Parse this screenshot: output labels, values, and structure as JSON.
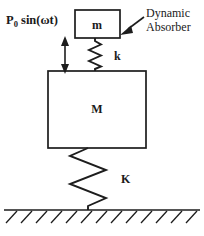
{
  "diagram": {
    "figure_type": "two-degree-of-freedom mass-spring system",
    "background_color": "#ffffff",
    "line_color": "#1d1d1d",
    "canvas": {
      "width": 204,
      "height": 236
    }
  },
  "labels": {
    "force": {
      "base": "P",
      "subscript": "0",
      "expression": " sin(ωt)",
      "full_text": "P0 sin(ωt)",
      "x": 6,
      "y": 24
    },
    "absorber_mass": {
      "text": "m",
      "x": 97,
      "y": 29
    },
    "absorber_spring": {
      "text": "k",
      "x": 114,
      "y": 60
    },
    "main_mass": {
      "text": "M",
      "x": 97,
      "y": 113
    },
    "main_spring": {
      "text": "K",
      "x": 121,
      "y": 183
    },
    "annotation": {
      "line1": "Dynamic",
      "line2": "Absorber",
      "x": 146,
      "y_line1": 17,
      "y_line2": 31
    }
  },
  "geometry": {
    "absorber_box": {
      "x": 75,
      "y": 10,
      "width": 45,
      "height": 28
    },
    "main_box": {
      "x": 48,
      "y": 71,
      "width": 98,
      "height": 77
    },
    "absorber_spring": {
      "cx": 95,
      "y_top": 38,
      "y_bottom": 71,
      "coils": 4,
      "amplitude": 6
    },
    "main_spring": {
      "cx": 88,
      "y_top": 148,
      "y_bottom": 210,
      "coils": 4,
      "amplitude": 18
    },
    "force_arrow": {
      "x": 65,
      "y_top": 38,
      "y_bottom": 72
    },
    "pointer_arrow": {
      "x_tail": 145,
      "y_tail": 16,
      "x_head": 122,
      "y_head": 33
    },
    "ground": {
      "x_start": 4,
      "x_end": 200,
      "y": 210,
      "hatch_count": 13,
      "hatch_length": 15
    }
  }
}
